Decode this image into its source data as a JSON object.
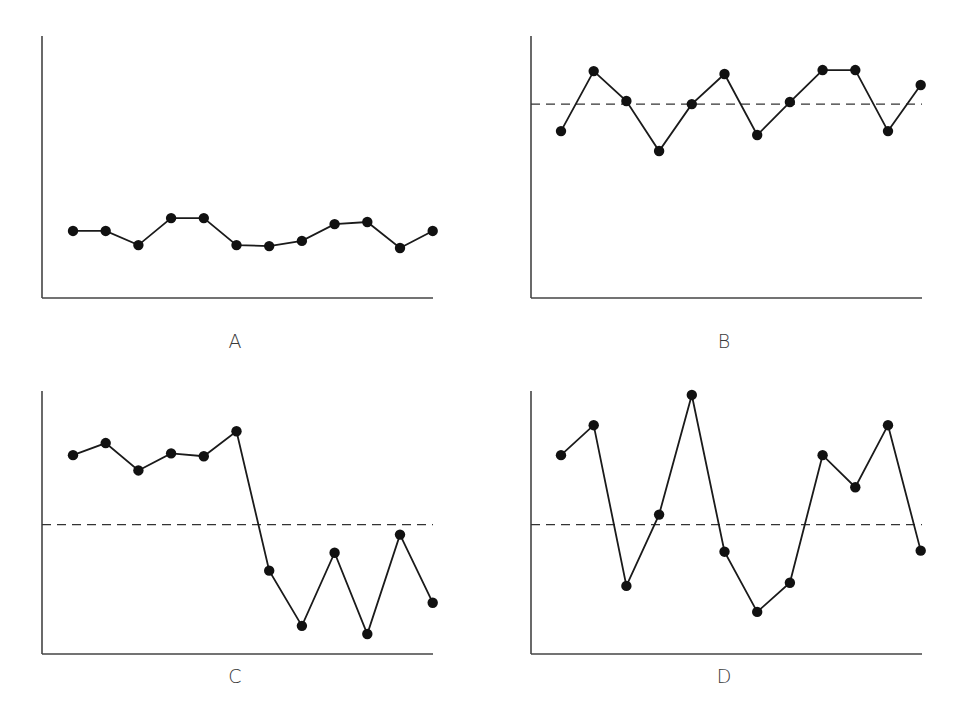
{
  "figure": {
    "panels": [
      {
        "id": "A",
        "label": "A"
      },
      {
        "id": "B",
        "label": "B"
      },
      {
        "id": "C",
        "label": "C"
      },
      {
        "id": "D",
        "label": "D"
      }
    ]
  },
  "style": {
    "line_color": "#1a1a1a",
    "marker_color": "#111111",
    "axis_color": "#444444",
    "dashed_color": "#333333"
  },
  "chart_data": [
    {
      "type": "line",
      "title": "A",
      "xlabel": "",
      "ylabel": "",
      "x": [
        1,
        2,
        3,
        4,
        5,
        6,
        7,
        8,
        9,
        10,
        11,
        12
      ],
      "series": [
        {
          "name": "A",
          "values": [
            25.6,
            25.6,
            20.2,
            30.5,
            30.5,
            20.2,
            19.8,
            21.8,
            28.2,
            29.0,
            19.1,
            25.6
          ]
        }
      ],
      "ylim": [
        0,
        100
      ],
      "center_line": null,
      "grid": false,
      "legend": null
    },
    {
      "type": "line",
      "title": "B",
      "xlabel": "",
      "ylabel": "",
      "x": [
        1,
        2,
        3,
        4,
        5,
        6,
        7,
        8,
        9,
        10,
        11,
        12
      ],
      "series": [
        {
          "name": "B",
          "values": [
            63.7,
            86.6,
            75.2,
            56.1,
            74.0,
            85.5,
            62.2,
            74.8,
            87.0,
            87.0,
            63.7,
            81.3
          ]
        }
      ],
      "ylim": [
        0,
        100
      ],
      "center_line": 74.0,
      "grid": false,
      "legend": null
    },
    {
      "type": "line",
      "title": "C",
      "xlabel": "",
      "ylabel": "",
      "x": [
        1,
        2,
        3,
        4,
        5,
        6,
        7,
        8,
        9,
        10,
        11,
        12
      ],
      "series": [
        {
          "name": "C",
          "values": [
            75.6,
            80.2,
            69.8,
            76.3,
            75.2,
            84.7,
            31.7,
            10.7,
            38.5,
            7.6,
            45.4,
            19.5
          ]
        }
      ],
      "ylim": [
        0,
        100
      ],
      "center_line": 49.2,
      "grid": false,
      "legend": null
    },
    {
      "type": "line",
      "title": "D",
      "xlabel": "",
      "ylabel": "",
      "x": [
        1,
        2,
        3,
        4,
        5,
        6,
        7,
        8,
        9,
        10,
        11,
        12
      ],
      "series": [
        {
          "name": "D",
          "values": [
            75.6,
            87.0,
            25.9,
            53.0,
            98.5,
            38.9,
            16.0,
            27.1,
            75.6,
            63.4,
            87.0,
            39.3
          ]
        }
      ],
      "ylim": [
        0,
        100
      ],
      "center_line": 49.2,
      "grid": false,
      "legend": null
    }
  ]
}
